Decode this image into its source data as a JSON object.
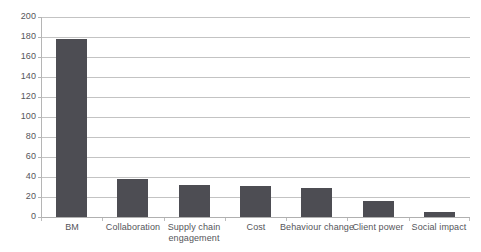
{
  "chart_data": {
    "type": "bar",
    "title": "",
    "subtitle": "",
    "xlabel": "",
    "ylabel": "",
    "ylim": [
      0,
      200
    ],
    "ytick_step": 20,
    "yticks": [
      0,
      20,
      40,
      60,
      80,
      100,
      120,
      140,
      160,
      180,
      200
    ],
    "ytick_labels": [
      "0",
      "20",
      "40",
      "60",
      "80",
      "100",
      "120",
      "140",
      "160",
      "180",
      "200"
    ],
    "grid": true,
    "grid_axis": "y",
    "legend": false,
    "legend_position": "none",
    "categories": [
      "BM",
      "Collaboration",
      "Supply chain engagement",
      "Cost",
      "Behaviour change",
      "Client power",
      "Social impact"
    ],
    "category_label_lines": [
      [
        "BM"
      ],
      [
        "Collaboration"
      ],
      [
        "Supply chain",
        "engagement"
      ],
      [
        "Cost"
      ],
      [
        "Behaviour change"
      ],
      [
        "Client power"
      ],
      [
        "Social impact"
      ]
    ],
    "values": [
      178,
      38,
      32,
      31,
      29,
      16,
      5
    ],
    "series": [
      {
        "name": "Count",
        "values": [
          178,
          38,
          32,
          31,
          29,
          16,
          5
        ]
      }
    ],
    "colors": {
      "bar": "#4d4d53",
      "grid": "#c3c3c3",
      "axis": "#b5b5b5",
      "text": "#55555a",
      "background": "#ffffff"
    }
  }
}
